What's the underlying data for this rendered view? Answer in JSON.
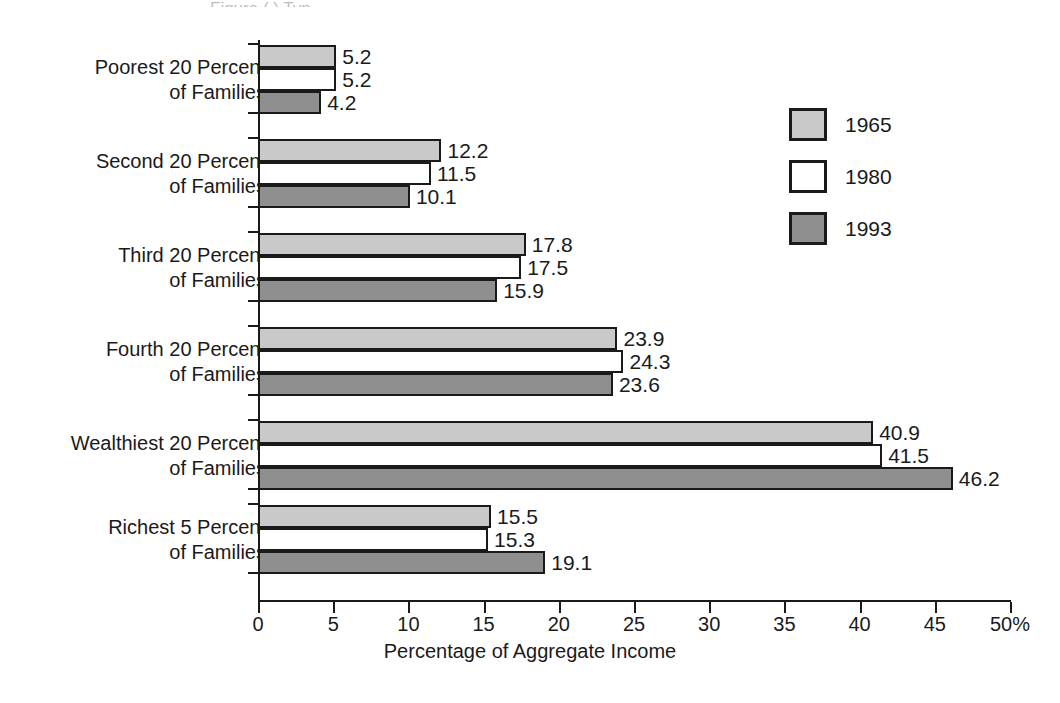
{
  "top_sliver_text": "Figure ( ) Typ",
  "chart_data": {
    "type": "bar",
    "orientation": "horizontal",
    "title": "",
    "xlabel": "Percentage of Aggregate Income",
    "ylabel": "",
    "xlim": [
      0,
      50
    ],
    "xticks": [
      0,
      5,
      10,
      15,
      20,
      25,
      30,
      35,
      40,
      45,
      50
    ],
    "xtick_labels": [
      "0",
      "5",
      "10",
      "15",
      "20",
      "25",
      "30",
      "35",
      "40",
      "45",
      "50%"
    ],
    "grid": false,
    "legend_position": "right",
    "categories": [
      "Poorest 20 Percent of Families",
      "Second 20 Percent of Families",
      "Third 20 Percent of Families",
      "Fourth 20 Percent of Families",
      "Wealthiest 20 Percent of Families",
      "Richest 5 Percent of Families"
    ],
    "category_lines": [
      [
        "Poorest 20 Percent",
        "of Families"
      ],
      [
        "Second 20 Percent",
        "of Families"
      ],
      [
        "Third 20 Percent",
        "of Families"
      ],
      [
        "Fourth 20 Percent",
        "of Families"
      ],
      [
        "Wealthiest 20 Percent",
        "of Families"
      ],
      [
        "Richest 5 Percent",
        "of Families"
      ]
    ],
    "series": [
      {
        "name": "1965",
        "color": "#c9c9c9",
        "values": [
          5.2,
          12.2,
          17.8,
          23.9,
          40.9,
          15.5
        ],
        "labels": [
          "5.2",
          "12.2",
          "17.8",
          "23.9",
          "40.9",
          "15.5"
        ]
      },
      {
        "name": "1980",
        "color": "#ffffff",
        "values": [
          5.2,
          11.5,
          17.5,
          24.3,
          41.5,
          15.3
        ],
        "labels": [
          "5.2",
          "11.5",
          "17.5",
          "24.3",
          "41.5",
          "15.3"
        ]
      },
      {
        "name": "1993",
        "color": "#8f8f8f",
        "values": [
          4.2,
          10.1,
          15.9,
          23.6,
          46.2,
          19.1
        ],
        "labels": [
          "4.2",
          "10.1",
          "15.9",
          "23.6",
          "46.2",
          "19.1"
        ]
      }
    ]
  },
  "legend": {
    "items": [
      {
        "label": "1965",
        "swatch": "s1965"
      },
      {
        "label": "1980",
        "swatch": "s1980"
      },
      {
        "label": "1993",
        "swatch": "s1993"
      }
    ]
  }
}
